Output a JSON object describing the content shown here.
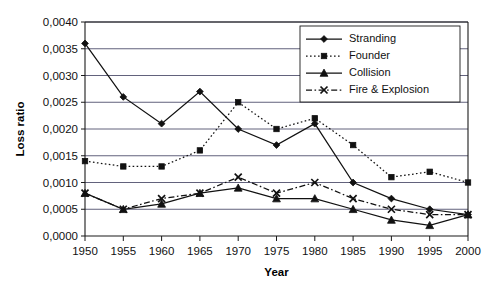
{
  "chart_data": {
    "type": "line",
    "title": "",
    "xlabel": "Year",
    "ylabel": "Loss ratio",
    "x": [
      1950,
      1955,
      1960,
      1965,
      1970,
      1975,
      1980,
      1985,
      1990,
      1995,
      2000
    ],
    "categories": [
      "1950",
      "1955",
      "1960",
      "1965",
      "1970",
      "1975",
      "1980",
      "1985",
      "1990",
      "1995",
      "2000"
    ],
    "xlim": [
      1950,
      2000
    ],
    "ylim": [
      0.0,
      0.004
    ],
    "ytick_labels": [
      "0,0000",
      "0,0005",
      "0,0010",
      "0,0015",
      "0,0020",
      "0,0025",
      "0,0030",
      "0,0035",
      "0,0040"
    ],
    "ytick_values": [
      0.0,
      0.0005,
      0.001,
      0.0015,
      0.002,
      0.0025,
      0.003,
      0.0035,
      0.004
    ],
    "grid": true,
    "legend_position": "top-right",
    "series": [
      {
        "name": "Stranding",
        "marker": "diamond",
        "dash": "solid",
        "values": [
          0.0036,
          0.0026,
          0.0021,
          0.0027,
          0.002,
          0.0017,
          0.0021,
          0.001,
          0.0007,
          0.0005,
          0.0004
        ]
      },
      {
        "name": "Founder",
        "marker": "square",
        "dash": "dotted",
        "values": [
          0.0014,
          0.0013,
          0.0013,
          0.0016,
          0.0025,
          0.002,
          0.0022,
          0.0017,
          0.0011,
          0.0012,
          0.001
        ]
      },
      {
        "name": "Collision",
        "marker": "triangle",
        "dash": "solid",
        "values": [
          0.0008,
          0.0005,
          0.0006,
          0.0008,
          0.0009,
          0.0007,
          0.0007,
          0.0005,
          0.0003,
          0.0002,
          0.0004
        ]
      },
      {
        "name": "Fire & Explosion",
        "marker": "cross",
        "dash": "dashdot",
        "values": [
          0.0008,
          0.0005,
          0.0007,
          0.0008,
          0.0011,
          0.0008,
          0.001,
          0.0007,
          0.0005,
          0.0004,
          0.0004
        ]
      }
    ]
  },
  "colors": {
    "line": "#111111",
    "grid": "#3a3a5a",
    "axis": "#1a1a1a",
    "background": "#ffffff"
  }
}
